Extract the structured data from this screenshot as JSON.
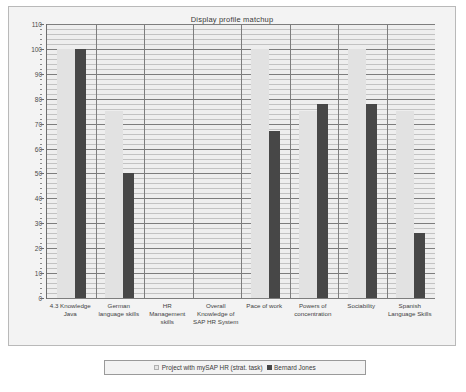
{
  "chart_data": {
    "type": "bar",
    "title": "Display profile matchup",
    "xlabel": "",
    "ylabel": "",
    "ylim": [
      0,
      110
    ],
    "ytick_step": 10,
    "yminor_step": 2,
    "grid": true,
    "legend_position": "bottom",
    "categories": [
      "4.3 Knowledge Java",
      "German language skills",
      "HR Management skills",
      "Overall Knowledge of SAP HR System",
      "Pace of work",
      "Powers of concentration",
      "Sociability",
      "Spanish Language Skills"
    ],
    "category_lines": [
      [
        "4.3 Knowledge",
        "Java"
      ],
      [
        "German",
        "language skills"
      ],
      [
        "HR",
        "Management",
        "skills"
      ],
      [
        "Overall",
        "Knowledge of",
        "SAP HR System"
      ],
      [
        "Pace of work"
      ],
      [
        "Powers of",
        "concentration"
      ],
      [
        "Sociability"
      ],
      [
        "Spanish",
        "Language Skills"
      ]
    ],
    "yticks": [
      0,
      10,
      20,
      30,
      40,
      50,
      60,
      70,
      80,
      90,
      100,
      110
    ],
    "series": [
      {
        "name": "Project with mySAP HR (strat. task)",
        "color": "#e2e2e2",
        "values": [
          100,
          75,
          0,
          0,
          100,
          75,
          100,
          75
        ]
      },
      {
        "name": "Bernard Jones",
        "color": "#474747",
        "values": [
          100,
          50,
          0,
          0,
          67,
          78,
          78,
          26
        ]
      }
    ]
  },
  "legend": {
    "entries": [
      {
        "label": "Project with mySAP HR (strat. task)",
        "swatch": "light"
      },
      {
        "label": "Bernard Jones",
        "swatch": "dark"
      }
    ]
  },
  "colors": {
    "panel_background": "#f3f3f3",
    "plot_background": "#eeeeee",
    "axis": "#6d6d6d",
    "major_gridline": "#7d7d7d",
    "minor_gridline": "#c2c2c2",
    "series_light": "#e2e2e2",
    "series_dark": "#474747",
    "text": "#3a3a3a"
  }
}
